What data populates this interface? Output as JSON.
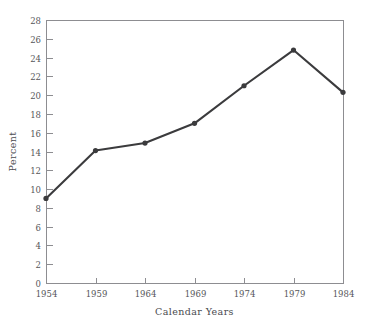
{
  "chart_data": {
    "type": "line",
    "title": "",
    "xlabel": "Calendar Years",
    "ylabel": "Percent",
    "x": [
      1954,
      1959,
      1964,
      1969,
      1974,
      1979,
      1984
    ],
    "categories": [
      "1954",
      "1959",
      "1964",
      "1969",
      "1974",
      "1979",
      "1984"
    ],
    "values": [
      9.0,
      14.1,
      14.9,
      17.0,
      21.0,
      24.8,
      20.3
    ],
    "series": [
      {
        "name": "Percent",
        "values": [
          9.0,
          14.1,
          14.9,
          17.0,
          21.0,
          24.8,
          20.3
        ]
      }
    ],
    "xlim": [
      1954,
      1984
    ],
    "ylim": [
      0,
      28
    ],
    "xticks": [
      "1954",
      "1959",
      "1964",
      "1969",
      "1974",
      "1979",
      "1984"
    ],
    "yticks": [
      "0",
      "2",
      "4",
      "6",
      "8",
      "10",
      "12",
      "14",
      "16",
      "18",
      "20",
      "22",
      "24",
      "26",
      "28"
    ],
    "ytick_step": 2,
    "xtick_step": 5,
    "grid": false,
    "legend": false,
    "legend_position": "none",
    "marker": "circle",
    "line_color": "#3b3b3d",
    "marker_color": "#3b3b3d",
    "axis_color": "#8d8d91",
    "text_color": "#56565a",
    "background_color": "#ffffff"
  }
}
